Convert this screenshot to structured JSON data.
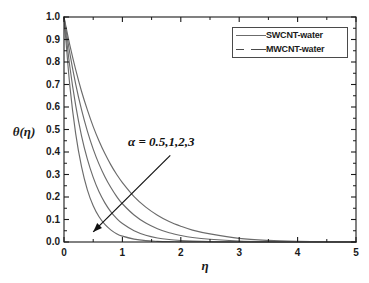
{
  "chart_data": {
    "type": "line",
    "title": "",
    "xlabel": "η",
    "ylabel": "θ(η)",
    "xlim": [
      0,
      5
    ],
    "ylim": [
      0.0,
      1.0
    ],
    "grid": false,
    "xticks": [
      "0",
      "1",
      "2",
      "3",
      "4",
      "5"
    ],
    "xtick_values": [
      0,
      1,
      2,
      3,
      4,
      5
    ],
    "xminor_values": [
      0.5,
      1.5,
      2.5,
      3.5,
      4.5
    ],
    "yticks": [
      "0.0",
      "0.1",
      "0.2",
      "0.3",
      "0.4",
      "0.5",
      "0.6",
      "0.7",
      "0.8",
      "0.9",
      "1.0"
    ],
    "ytick_values": [
      0.0,
      0.1,
      0.2,
      0.3,
      0.4,
      0.5,
      0.6,
      0.7,
      0.8,
      0.9,
      1.0
    ],
    "annotation": "α = 0.5,1,2,3",
    "annotation_arrow": {
      "from_x": 1.82,
      "from_y": 0.385,
      "to_x": 0.5,
      "to_y": 0.045
    },
    "legend_position": "top-right",
    "legend": [
      {
        "label": "SWCNT-water",
        "style": "solid",
        "color": "#6b6b6b"
      },
      {
        "label": "MWCNT-water",
        "style": "dashed",
        "color": "#4a4a4a"
      }
    ],
    "series": [
      {
        "name": "SWCNT-water α=0.5",
        "alpha": 0.5,
        "style": "solid",
        "color": "#6b6b6b",
        "x": [
          0.0,
          0.1,
          0.2,
          0.3,
          0.4,
          0.5,
          0.6,
          0.7,
          0.8,
          0.9,
          1.0,
          1.2,
          1.4,
          1.6,
          1.8,
          2.0,
          2.2,
          2.5,
          3.0,
          3.5,
          4.0,
          4.5,
          5.0
        ],
        "y": [
          1.0,
          0.694,
          0.482,
          0.335,
          0.232,
          0.161,
          0.112,
          0.078,
          0.054,
          0.037,
          0.026,
          0.013,
          0.006,
          0.003,
          0.0014,
          0.0007,
          0.0003,
          0.0001,
          0.0,
          0.0,
          0.0,
          0.0,
          0.0
        ]
      },
      {
        "name": "SWCNT-water α=1",
        "alpha": 1,
        "style": "solid",
        "color": "#6b6b6b",
        "x": [
          0.0,
          0.1,
          0.2,
          0.3,
          0.4,
          0.5,
          0.6,
          0.7,
          0.8,
          0.9,
          1.0,
          1.2,
          1.4,
          1.6,
          1.8,
          2.0,
          2.2,
          2.5,
          3.0,
          3.5,
          4.0,
          4.5,
          5.0
        ],
        "y": [
          1.0,
          0.779,
          0.607,
          0.472,
          0.368,
          0.287,
          0.223,
          0.174,
          0.135,
          0.105,
          0.082,
          0.05,
          0.03,
          0.018,
          0.011,
          0.0067,
          0.0041,
          0.0019,
          0.0005,
          0.0001,
          0.0,
          0.0,
          0.0
        ]
      },
      {
        "name": "MWCNT-water α=2",
        "alpha": 2,
        "style": "solid",
        "color": "#6b6b6b",
        "x": [
          0.0,
          0.1,
          0.2,
          0.3,
          0.4,
          0.5,
          0.6,
          0.7,
          0.8,
          0.9,
          1.0,
          1.2,
          1.4,
          1.6,
          1.8,
          2.0,
          2.2,
          2.5,
          3.0,
          3.5,
          4.0,
          4.5,
          5.0
        ],
        "y": [
          1.0,
          0.838,
          0.702,
          0.588,
          0.493,
          0.413,
          0.346,
          0.29,
          0.243,
          0.203,
          0.17,
          0.12,
          0.084,
          0.059,
          0.041,
          0.029,
          0.02,
          0.012,
          0.0042,
          0.0014,
          0.0005,
          0.0002,
          0.0001
        ]
      },
      {
        "name": "MWCNT-water α=3",
        "alpha": 3,
        "style": "solid",
        "color": "#6b6b6b",
        "x": [
          0.0,
          0.1,
          0.2,
          0.3,
          0.4,
          0.5,
          0.6,
          0.7,
          0.8,
          0.9,
          1.0,
          1.2,
          1.4,
          1.6,
          1.8,
          2.0,
          2.2,
          2.5,
          3.0,
          3.5,
          4.0,
          4.5,
          5.0
        ],
        "y": [
          1.0,
          0.875,
          0.766,
          0.67,
          0.587,
          0.513,
          0.449,
          0.393,
          0.344,
          0.301,
          0.264,
          0.202,
          0.155,
          0.119,
          0.091,
          0.07,
          0.053,
          0.036,
          0.016,
          0.007,
          0.003,
          0.0013,
          0.0006
        ]
      }
    ]
  },
  "figure": {
    "background": "#ffffff",
    "axis_color": "#1a1a1a",
    "curve_color": "#6b6b6b"
  }
}
